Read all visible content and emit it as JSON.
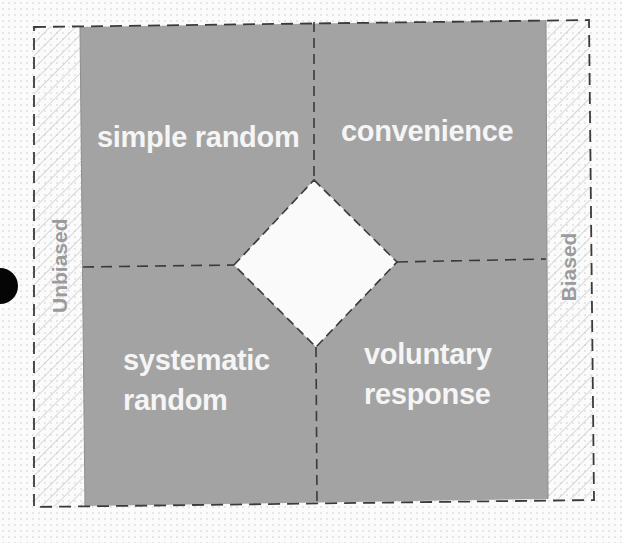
{
  "diagram": {
    "type": "quadrant-sampling-methods",
    "colors": {
      "panel_fill": "#a3a3a3",
      "quadrant_text": "#f5f5f5",
      "side_label_text": "#9b9b9b",
      "hatch_stroke": "#c8c8c8",
      "dash_stroke": "#3a3a3a",
      "center_diamond_fill": "#fafafa",
      "marker_dot": "#050505"
    },
    "side_labels": {
      "left": "Unbiased",
      "right": "Biased"
    },
    "quadrants": {
      "top_left": {
        "label": "simple random"
      },
      "top_right": {
        "label": "convenience"
      },
      "bottom_left": {
        "label_line1": "systematic",
        "label_line2": "random"
      },
      "bottom_right": {
        "label_line1": "voluntary",
        "label_line2": "response"
      }
    },
    "center": {
      "shape": "diamond",
      "content": ""
    }
  }
}
